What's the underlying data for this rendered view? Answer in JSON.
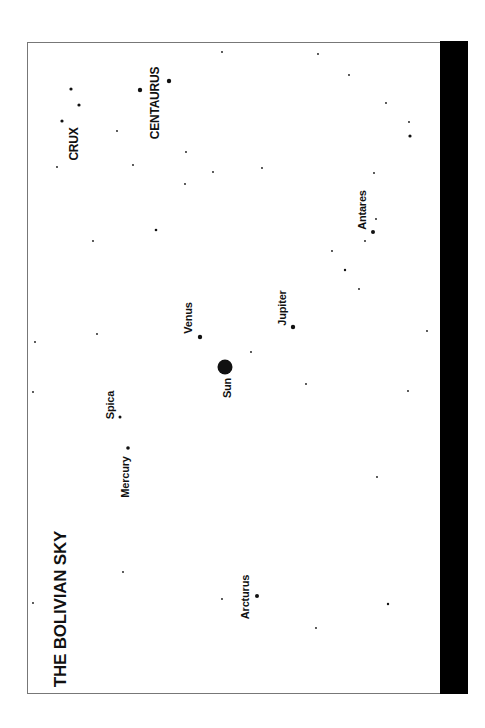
{
  "title": "THE BOLIVIAN SKY",
  "colors": {
    "background": "#ffffff",
    "ink": "#111111",
    "frame": "#777777",
    "bar": "#000000"
  },
  "labels": {
    "crux": "CRUX",
    "centaurus": "CENTAURUS",
    "antares": "Antares",
    "venus": "Venus",
    "jupiter": "Jupiter",
    "sun": "Sun",
    "spica": "Spica",
    "mercury": "Mercury",
    "arcturus": "Arcturus"
  },
  "named_bodies": [
    {
      "name": "Sun",
      "x": 225,
      "y": 367,
      "r": 7.5
    },
    {
      "name": "Venus",
      "x": 200,
      "y": 337,
      "r": 2.2
    },
    {
      "name": "Jupiter",
      "x": 293,
      "y": 327,
      "r": 2.2
    },
    {
      "name": "Mercury",
      "x": 128,
      "y": 448,
      "r": 1.8
    },
    {
      "name": "Spica",
      "x": 120,
      "y": 417,
      "r": 1.5
    },
    {
      "name": "Antares",
      "x": 373,
      "y": 232,
      "r": 2
    },
    {
      "name": "Arcturus",
      "x": 257,
      "y": 596,
      "r": 2
    },
    {
      "name": "Centaurus-a",
      "x": 140,
      "y": 90,
      "r": 2.2
    },
    {
      "name": "Centaurus-b",
      "x": 169,
      "y": 81,
      "r": 2.2
    },
    {
      "name": "Crux-a",
      "x": 71,
      "y": 89,
      "r": 1.6
    },
    {
      "name": "Crux-b",
      "x": 79,
      "y": 105,
      "r": 1.6
    },
    {
      "name": "Crux-c",
      "x": 62,
      "y": 121,
      "r": 1.6
    }
  ],
  "field_stars": [
    [
      222,
      52
    ],
    [
      318,
      54
    ],
    [
      349,
      75
    ],
    [
      386,
      103
    ],
    [
      409,
      122
    ],
    [
      410,
      136,
      1.6
    ],
    [
      117,
      131
    ],
    [
      57,
      167
    ],
    [
      133,
      165
    ],
    [
      186,
      152
    ],
    [
      213,
      172
    ],
    [
      262,
      168
    ],
    [
      374,
      173
    ],
    [
      185,
      184
    ],
    [
      156,
      230,
      1.3
    ],
    [
      93,
      241
    ],
    [
      376,
      219
    ],
    [
      365,
      241
    ],
    [
      332,
      251
    ],
    [
      345,
      270,
      1.2
    ],
    [
      359,
      289
    ],
    [
      427,
      331
    ],
    [
      35,
      342
    ],
    [
      97,
      334
    ],
    [
      251,
      352
    ],
    [
      306,
      384
    ],
    [
      408,
      391
    ],
    [
      33,
      392
    ],
    [
      377,
      477
    ],
    [
      388,
      604,
      1.2
    ],
    [
      33,
      603
    ],
    [
      123,
      572
    ],
    [
      222,
      599
    ],
    [
      316,
      628
    ]
  ]
}
